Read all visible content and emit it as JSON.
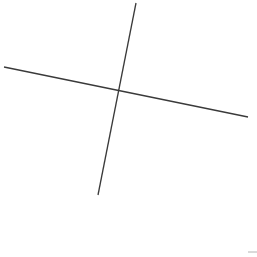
{
  "canvas": {
    "width": 257,
    "height": 257,
    "background_color": "#ffffff",
    "description": "Two straight line segments crossing near the upper-left-of-center on a plain white field"
  },
  "chart_data": {
    "type": "scatter",
    "title": "",
    "subtitle": "",
    "xlabel": "",
    "ylabel": "",
    "grid": false,
    "legend_position": "none",
    "axes_visible": false,
    "tick_labels": [],
    "annotations": [],
    "xlim": [
      0,
      257
    ],
    "ylim": [
      257,
      0
    ],
    "series": [
      {
        "name": "steep-segment",
        "kind": "line-segment",
        "color": "#3a3a3a",
        "stroke_width": 1.3,
        "x": [
          136,
          98
        ],
        "y": [
          3,
          195
        ]
      },
      {
        "name": "shallow-segment",
        "kind": "line-segment",
        "color": "#3a3a3a",
        "stroke_width": 1.3,
        "x": [
          4,
          248
        ],
        "y": [
          67,
          117
        ]
      },
      {
        "name": "corner-fragment",
        "kind": "line-segment",
        "color": "#b4b4b4",
        "stroke_width": 1.0,
        "x": [
          248,
          257
        ],
        "y": [
          252,
          252
        ]
      }
    ],
    "intersections": [
      {
        "name": "crossing-point",
        "x": 117,
        "y": 89
      }
    ]
  },
  "colors": {
    "stroke": "#3a3a3a",
    "faint_stroke": "#b4b4b4",
    "background": "#ffffff"
  }
}
